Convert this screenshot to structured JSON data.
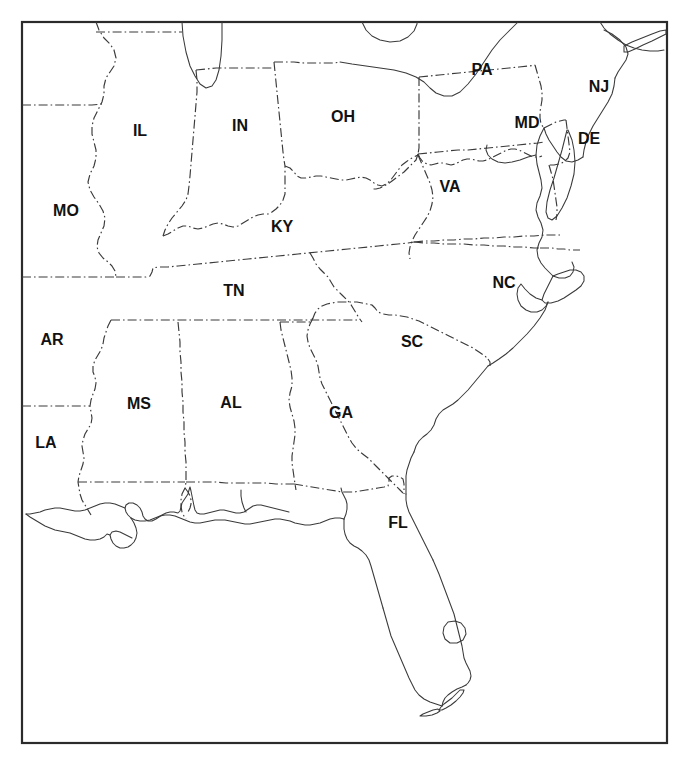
{
  "map": {
    "title": "Southeastern United States Outline Map",
    "description": "Black and white outline map of the southeastern and mid-Atlantic United States with two-letter state abbreviation labels",
    "background_color": "#ffffff",
    "frame_color": "#2b2b2b",
    "border_line_color": "#3a3a3a",
    "coastline_color": "#3a3a3a",
    "label_color": "#111111",
    "label_font_size": 16,
    "border_style": "dash-dot",
    "frame": {
      "x": 21,
      "y": 21,
      "width": 646,
      "height": 722
    },
    "labels": [
      {
        "abbr": "IL",
        "name": "Illinois",
        "x": 140,
        "y": 132
      },
      {
        "abbr": "IN",
        "name": "Indiana",
        "x": 240,
        "y": 127
      },
      {
        "abbr": "OH",
        "name": "Ohio",
        "x": 343,
        "y": 118
      },
      {
        "abbr": "PA",
        "name": "Pennsylvania",
        "x": 482,
        "y": 71
      },
      {
        "abbr": "NJ",
        "name": "New Jersey",
        "x": 599,
        "y": 88
      },
      {
        "abbr": "MD",
        "name": "Maryland",
        "x": 527,
        "y": 124
      },
      {
        "abbr": "DE",
        "name": "Delaware",
        "x": 589,
        "y": 140
      },
      {
        "abbr": "MO",
        "name": "Missouri",
        "x": 66,
        "y": 212
      },
      {
        "abbr": "KY",
        "name": "Kentucky",
        "x": 282,
        "y": 228
      },
      {
        "abbr": "VA",
        "name": "Virginia",
        "x": 450,
        "y": 188
      },
      {
        "abbr": "TN",
        "name": "Tennessee",
        "x": 234,
        "y": 292
      },
      {
        "abbr": "NC",
        "name": "North Carolina",
        "x": 504,
        "y": 284
      },
      {
        "abbr": "AR",
        "name": "Arkansas",
        "x": 52,
        "y": 341
      },
      {
        "abbr": "SC",
        "name": "South Carolina",
        "x": 412,
        "y": 343
      },
      {
        "abbr": "MS",
        "name": "Mississippi",
        "x": 139,
        "y": 405
      },
      {
        "abbr": "AL",
        "name": "Alabama",
        "x": 231,
        "y": 404
      },
      {
        "abbr": "GA",
        "name": "Georgia",
        "x": 341,
        "y": 414
      },
      {
        "abbr": "LA",
        "name": "Louisiana",
        "x": 46,
        "y": 444
      },
      {
        "abbr": "FL",
        "name": "Florida",
        "x": 398,
        "y": 524
      }
    ],
    "features": {
      "lakes": [
        "Lake Michigan",
        "Lake Erie",
        "Lake Okeechobee"
      ],
      "water_bodies": [
        "Chesapeake Bay",
        "Gulf of Mexico",
        "Atlantic Ocean"
      ],
      "landforms": [
        "Florida Peninsula",
        "Florida Keys",
        "Delmarva Peninsula",
        "Long Island",
        "Mississippi River Delta",
        "Outer Banks"
      ]
    }
  }
}
